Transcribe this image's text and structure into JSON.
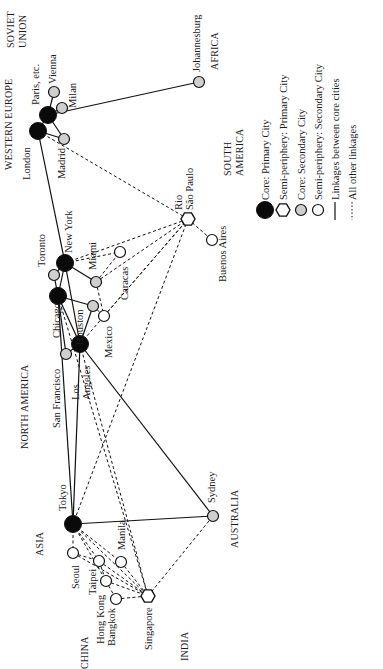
{
  "regions": [
    {
      "id": "soviet-union-1",
      "label": "SOVIET",
      "x": 14,
      "y": 48
    },
    {
      "id": "soviet-union-2",
      "label": "UNION",
      "x": 26,
      "y": 48
    },
    {
      "id": "western-europe",
      "label": "WESTERN EUROPE",
      "x": 12,
      "y": 170
    },
    {
      "id": "africa",
      "label": "AFRICA",
      "x": 218,
      "y": 70
    },
    {
      "id": "south-america-1",
      "label": "SOUTH",
      "x": 231,
      "y": 176
    },
    {
      "id": "south-america-2",
      "label": "AMERICA",
      "x": 243,
      "y": 176
    },
    {
      "id": "north-america",
      "label": "NORTH AMERICA",
      "x": 28,
      "y": 449
    },
    {
      "id": "asia",
      "label": "ASIA",
      "x": 43,
      "y": 556
    },
    {
      "id": "australia",
      "label": "AUSTRALIA",
      "x": 238,
      "y": 548
    },
    {
      "id": "china",
      "label": "CHINA",
      "x": 88,
      "y": 669
    },
    {
      "id": "india",
      "label": "INDIA",
      "x": 188,
      "y": 661
    }
  ],
  "cities": [
    {
      "id": "london",
      "name": "London",
      "type": "core-primary",
      "x": 38,
      "y": 131,
      "lx": 30,
      "ly": 180
    },
    {
      "id": "paris",
      "name": "Paris, etc.",
      "type": "core-primary",
      "x": 48,
      "y": 115,
      "lx": 39,
      "ly": 105
    },
    {
      "id": "vienna",
      "name": "Vienna",
      "type": "semi-secondary-grey",
      "x": 54,
      "y": 92,
      "lx": 56,
      "ly": 84
    },
    {
      "id": "milan",
      "name": "Milan",
      "type": "core-secondary",
      "x": 62,
      "y": 108,
      "lx": 76,
      "ly": 108
    },
    {
      "id": "madrid",
      "name": "Madrid",
      "type": "core-secondary",
      "x": 64,
      "y": 139,
      "lx": 65,
      "ly": 179
    },
    {
      "id": "johannesburg",
      "name": "Johannesburg",
      "type": "core-secondary",
      "x": 199,
      "y": 82,
      "lx": 200,
      "ly": 72
    },
    {
      "id": "rio-sao-paulo",
      "name": "Rio",
      "name2": "São Paulo",
      "type": "semi-primary",
      "x": 188,
      "y": 219,
      "lx": 182,
      "ly": 210
    },
    {
      "id": "buenos-aires",
      "name": "Buenos Aires",
      "type": "semi-secondary",
      "x": 212,
      "y": 240,
      "lx": 226,
      "ly": 282
    },
    {
      "id": "new-york",
      "name": "New York",
      "type": "core-primary",
      "x": 65,
      "y": 263,
      "lx": 72,
      "ly": 253
    },
    {
      "id": "toronto",
      "name": "Toronto",
      "type": "core-secondary",
      "x": 54,
      "y": 275,
      "lx": 45,
      "ly": 267
    },
    {
      "id": "chicago",
      "name": "Chicago",
      "type": "core-primary",
      "x": 58,
      "y": 296,
      "lx": 60,
      "ly": 338
    },
    {
      "id": "miami",
      "name": "Miami",
      "type": "core-secondary",
      "x": 96,
      "y": 282,
      "lx": 96,
      "ly": 270
    },
    {
      "id": "caracas",
      "name": "Caracas",
      "type": "semi-secondary",
      "x": 120,
      "y": 252,
      "lx": 128,
      "ly": 300
    },
    {
      "id": "houston",
      "name": "Houston",
      "type": "core-secondary",
      "x": 93,
      "y": 306,
      "lx": 83,
      "ly": 345
    },
    {
      "id": "mexico",
      "name": "Mexico",
      "type": "semi-secondary",
      "x": 104,
      "y": 316,
      "lx": 112,
      "ly": 358
    },
    {
      "id": "los-angeles",
      "name": "Los",
      "name2": "Angeles",
      "type": "core-primary",
      "x": 80,
      "y": 344,
      "lx": 79,
      "ly": 400
    },
    {
      "id": "san-francisco",
      "name": "San Francisco",
      "type": "core-secondary",
      "x": 66,
      "y": 354,
      "lx": 60,
      "ly": 428
    },
    {
      "id": "tokyo",
      "name": "Tokyo",
      "type": "core-primary",
      "x": 73,
      "y": 524,
      "lx": 66,
      "ly": 511
    },
    {
      "id": "sydney",
      "name": "Sydney",
      "type": "core-secondary",
      "x": 213,
      "y": 516,
      "lx": 215,
      "ly": 503
    },
    {
      "id": "seoul",
      "name": "Seoul",
      "type": "semi-secondary",
      "x": 73,
      "y": 553,
      "lx": 79,
      "ly": 589
    },
    {
      "id": "taipei",
      "name": "Taipei",
      "type": "semi-secondary",
      "x": 99,
      "y": 561,
      "lx": 96,
      "ly": 595
    },
    {
      "id": "manila",
      "name": "Manila",
      "type": "semi-secondary",
      "x": 121,
      "y": 562,
      "lx": 125,
      "ly": 550
    },
    {
      "id": "hong-kong",
      "name": "Hong Kong",
      "type": "semi-secondary",
      "x": 106,
      "y": 581,
      "lx": 104,
      "ly": 644
    },
    {
      "id": "bangkok",
      "name": "Bangkok",
      "type": "semi-secondary",
      "x": 116,
      "y": 599,
      "lx": 115,
      "ly": 646
    },
    {
      "id": "singapore",
      "name": "Singapore",
      "type": "semi-primary",
      "x": 148,
      "y": 596,
      "lx": 152,
      "ly": 650
    }
  ],
  "core_links": [
    [
      "london",
      "paris"
    ],
    [
      "london",
      "new-york"
    ],
    [
      "paris",
      "johannesburg"
    ],
    [
      "new-york",
      "chicago"
    ],
    [
      "new-york",
      "los-angeles"
    ],
    [
      "chicago",
      "los-angeles"
    ],
    [
      "chicago",
      "tokyo"
    ],
    [
      "los-angeles",
      "tokyo"
    ],
    [
      "los-angeles",
      "sydney"
    ],
    [
      "tokyo",
      "sydney"
    ],
    [
      "paris",
      "vienna"
    ],
    [
      "paris",
      "milan"
    ],
    [
      "london",
      "madrid"
    ],
    [
      "paris",
      "madrid"
    ],
    [
      "new-york",
      "toronto"
    ],
    [
      "new-york",
      "miami"
    ],
    [
      "chicago",
      "toronto"
    ],
    [
      "chicago",
      "houston"
    ],
    [
      "los-angeles",
      "houston"
    ],
    [
      "los-angeles",
      "san-francisco"
    ],
    [
      "chicago",
      "san-francisco"
    ]
  ],
  "other_links": [
    [
      "london",
      "rio-sao-paulo"
    ],
    [
      "new-york",
      "rio-sao-paulo"
    ],
    [
      "miami",
      "rio-sao-paulo"
    ],
    [
      "miami",
      "caracas"
    ],
    [
      "new-york",
      "caracas"
    ],
    [
      "miami",
      "mexico"
    ],
    [
      "houston",
      "mexico"
    ],
    [
      "los-angeles",
      "mexico"
    ],
    [
      "mexico",
      "rio-sao-paulo"
    ],
    [
      "rio-sao-paulo",
      "buenos-aires"
    ],
    [
      "rio-sao-paulo",
      "tokyo"
    ],
    [
      "los-angeles",
      "singapore"
    ],
    [
      "mexico",
      "rio-sao-paulo"
    ],
    [
      "tokyo",
      "seoul"
    ],
    [
      "tokyo",
      "singapore"
    ],
    [
      "tokyo",
      "manila"
    ],
    [
      "tokyo",
      "taipei"
    ],
    [
      "tokyo",
      "hong-kong"
    ],
    [
      "seoul",
      "taipei"
    ],
    [
      "seoul",
      "singapore"
    ],
    [
      "taipei",
      "singapore"
    ],
    [
      "hong-kong",
      "singapore"
    ],
    [
      "bangkok",
      "singapore"
    ],
    [
      "manila",
      "singapore"
    ],
    [
      "taipei",
      "hong-kong"
    ],
    [
      "hong-kong",
      "bangkok"
    ],
    [
      "singapore",
      "sydney"
    ],
    [
      "chicago",
      "singapore"
    ]
  ],
  "legend": {
    "items": [
      {
        "symbol": "core-primary",
        "label": "Core: Primary City",
        "x": 265
      },
      {
        "symbol": "semi-primary",
        "label": "Semi-periphery: Primary City",
        "x": 283
      },
      {
        "symbol": "core-secondary",
        "label": "Core: Secondary City",
        "x": 301
      },
      {
        "symbol": "semi-secondary",
        "label": "Semi-periphery: Secondary City",
        "x": 318
      },
      {
        "symbol": "solid-line",
        "label": "Linkages between core cities",
        "x": 335
      },
      {
        "symbol": "dashed-line",
        "label": "All other linkages",
        "x": 352
      }
    ],
    "symbol_y": 210,
    "label_y": 200
  },
  "colors": {
    "ink": "#111111",
    "core_fill": "#0a0a0a",
    "secondary_fill": "#cfcfcf",
    "open_fill": "#ffffff",
    "background": "#ffffff"
  }
}
